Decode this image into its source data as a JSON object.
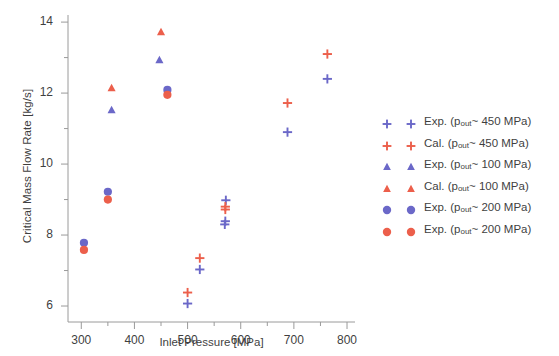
{
  "chart_data": {
    "type": "scatter",
    "title": "",
    "xlabel": "Inlet Pressure [MPa]",
    "ylabel": "Critical Mass Flow Rate [kg/s]",
    "xlim": [
      275,
      815
    ],
    "ylim": [
      5.55,
      14.2
    ],
    "xticks": [
      300,
      400,
      500,
      600,
      700,
      800
    ],
    "yticks": [
      6,
      8,
      10,
      12,
      14
    ],
    "xminor_step": 50,
    "yminor_step": 1,
    "grid": false,
    "legend_position": "right",
    "colors": {
      "blue": "#6b68c8",
      "red": "#ec5f4b"
    },
    "series": [
      {
        "name": "Exp. (p_out~ 450 MPa)",
        "label": "Exp. (p",
        "sub": "out",
        "label_tail": "~ 450 MPa)",
        "marker": "plus",
        "color": "#6b68c8",
        "points": [
          {
            "x": 500,
            "y": 6.07
          },
          {
            "x": 523,
            "y": 7.03
          },
          {
            "x": 570,
            "y": 8.3
          },
          {
            "x": 571,
            "y": 8.39
          },
          {
            "x": 688,
            "y": 10.9
          },
          {
            "x": 763,
            "y": 12.4
          },
          {
            "x": 572,
            "y": 8.98
          }
        ]
      },
      {
        "name": "Cal. (p_out~ 450 MPa)",
        "label": "Cal. (p",
        "sub": "out",
        "label_tail": "~ 450 MPa)",
        "marker": "plus",
        "color": "#ec5f4b",
        "points": [
          {
            "x": 500,
            "y": 6.38
          },
          {
            "x": 523,
            "y": 7.35
          },
          {
            "x": 571,
            "y": 8.72
          },
          {
            "x": 571,
            "y": 8.8
          },
          {
            "x": 688,
            "y": 11.72
          },
          {
            "x": 763,
            "y": 13.1
          }
        ]
      },
      {
        "name": "Exp. (p_out~ 100 MPa)",
        "label": "Exp. (p",
        "sub": "out",
        "label_tail": "~ 100 MPa)",
        "marker": "triangle",
        "color": "#6b68c8",
        "points": [
          {
            "x": 357,
            "y": 11.52
          },
          {
            "x": 447,
            "y": 12.93
          }
        ]
      },
      {
        "name": "Cal. (p_out~ 100 MPa)",
        "label": "Cal. (p",
        "sub": "out",
        "label_tail": "~ 100 MPa)",
        "marker": "triangle",
        "color": "#ec5f4b",
        "points": [
          {
            "x": 357,
            "y": 12.14
          },
          {
            "x": 450,
            "y": 13.72
          }
        ]
      },
      {
        "name": "Exp. (p_out~ 200 MPa) blue",
        "label": "Exp. (p",
        "sub": "out",
        "label_tail": "~ 200 MPa)",
        "marker": "circle",
        "color": "#6b68c8",
        "points": [
          {
            "x": 305,
            "y": 7.78
          },
          {
            "x": 350,
            "y": 9.22
          },
          {
            "x": 462,
            "y": 12.09
          }
        ]
      },
      {
        "name": "Exp. (p_out~ 200 MPa) red",
        "label": "Exp. (p",
        "sub": "out",
        "label_tail": "~ 200 MPa)",
        "marker": "circle",
        "color": "#ec5f4b",
        "points": [
          {
            "x": 305,
            "y": 7.58
          },
          {
            "x": 350,
            "y": 9.0
          },
          {
            "x": 462,
            "y": 11.95
          }
        ]
      }
    ]
  },
  "axis": {
    "xtick_labels": [
      "300",
      "400",
      "500",
      "600",
      "700",
      "800"
    ],
    "ytick_labels": [
      "6",
      "8",
      "10",
      "12",
      "14"
    ],
    "xlabel": "Inlet Pressure [MPa]",
    "ylabel": "Critical Mass Flow Rate [kg/s]"
  },
  "legend": {
    "entries": [
      {
        "prefix": "Exp. (p",
        "sub": "out",
        "tail": "~ 450 MPa)",
        "marker": "plus",
        "color": "#6b68c8"
      },
      {
        "prefix": "Cal. (p",
        "sub": "out",
        "tail": "~ 450 MPa)",
        "marker": "plus",
        "color": "#ec5f4b"
      },
      {
        "prefix": "Exp. (p",
        "sub": "out",
        "tail": "~ 100 MPa)",
        "marker": "triangle",
        "color": "#6b68c8"
      },
      {
        "prefix": "Cal. (p",
        "sub": "out",
        "tail": "~ 100 MPa)",
        "marker": "triangle",
        "color": "#ec5f4b"
      },
      {
        "prefix": "Exp. (p",
        "sub": "out",
        "tail": "~ 200 MPa)",
        "marker": "circle",
        "color": "#6b68c8"
      },
      {
        "prefix": "Exp. (p",
        "sub": "out",
        "tail": "~ 200 MPa)",
        "marker": "circle",
        "color": "#ec5f4b"
      }
    ]
  }
}
